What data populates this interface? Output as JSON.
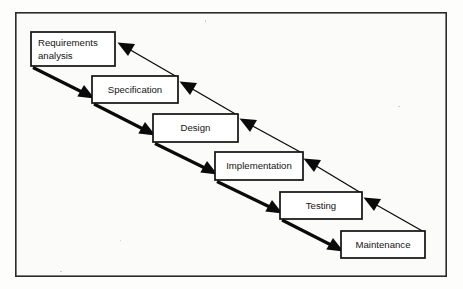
{
  "figure": {
    "type": "process-flow-diagram",
    "background_color": "#fdfdfb",
    "line_color": "#0a0a0a",
    "box_fill": "#ffffff",
    "border_color": "#2b2b2b"
  },
  "frame": {
    "x": 15,
    "y": 12,
    "width": 432,
    "height": 265
  },
  "phases": [
    {
      "id": "requirements-analysis",
      "label": "Requirements analysis",
      "lines": [
        "Requirements",
        "analysis"
      ],
      "align": "left",
      "order": 1,
      "box": {
        "x": 31,
        "y": 32,
        "width": 84,
        "height": 34
      }
    },
    {
      "id": "specification",
      "label": "Specification",
      "lines": [
        "Specification"
      ],
      "align": "center",
      "order": 2,
      "box": {
        "x": 92,
        "y": 76,
        "width": 86,
        "height": 27
      }
    },
    {
      "id": "design",
      "label": "Design",
      "lines": [
        "Design"
      ],
      "align": "center",
      "order": 3,
      "box": {
        "x": 153,
        "y": 114,
        "width": 85,
        "height": 28
      }
    },
    {
      "id": "implementation",
      "label": "Implementation",
      "lines": [
        "Implementation"
      ],
      "align": "center",
      "order": 4,
      "box": {
        "x": 215,
        "y": 152,
        "width": 88,
        "height": 28
      }
    },
    {
      "id": "testing",
      "label": "Testing",
      "lines": [
        "Testing"
      ],
      "align": "center",
      "order": 5,
      "box": {
        "x": 280,
        "y": 192,
        "width": 82,
        "height": 27
      }
    },
    {
      "id": "maintenance",
      "label": "Maintenance",
      "lines": [
        "Maintenance"
      ],
      "align": "center",
      "order": 6,
      "box": {
        "x": 341,
        "y": 231,
        "width": 84,
        "height": 27
      }
    }
  ],
  "connectors": {
    "forward": [
      {
        "id": "flow-requirements-to-specification",
        "from": "requirements-analysis",
        "to": "specification",
        "style": "solid-thick",
        "direction": "down-right"
      },
      {
        "id": "flow-specification-to-design",
        "from": "specification",
        "to": "design",
        "style": "solid-thick",
        "direction": "down-right"
      },
      {
        "id": "flow-design-to-implementation",
        "from": "design",
        "to": "implementation",
        "style": "solid-thick",
        "direction": "down-right"
      },
      {
        "id": "flow-implementation-to-testing",
        "from": "implementation",
        "to": "testing",
        "style": "solid-thick",
        "direction": "down-right"
      },
      {
        "id": "flow-testing-to-maintenance",
        "from": "testing",
        "to": "maintenance",
        "style": "solid-thick",
        "direction": "down-right"
      }
    ],
    "feedback": [
      {
        "id": "feedback-specification-to-requirements",
        "from": "specification",
        "to": "requirements-analysis",
        "style": "solid-thin",
        "direction": "up-left"
      },
      {
        "id": "feedback-design-to-specification",
        "from": "design",
        "to": "specification",
        "style": "solid-thin",
        "direction": "up-left"
      },
      {
        "id": "feedback-implementation-to-design",
        "from": "implementation",
        "to": "design",
        "style": "solid-thin",
        "direction": "up-left"
      },
      {
        "id": "feedback-testing-to-implementation",
        "from": "testing",
        "to": "implementation",
        "style": "solid-thin",
        "direction": "up-left"
      },
      {
        "id": "feedback-maintenance-to-testing",
        "from": "maintenance",
        "to": "testing",
        "style": "solid-thin",
        "direction": "up-left"
      }
    ]
  }
}
